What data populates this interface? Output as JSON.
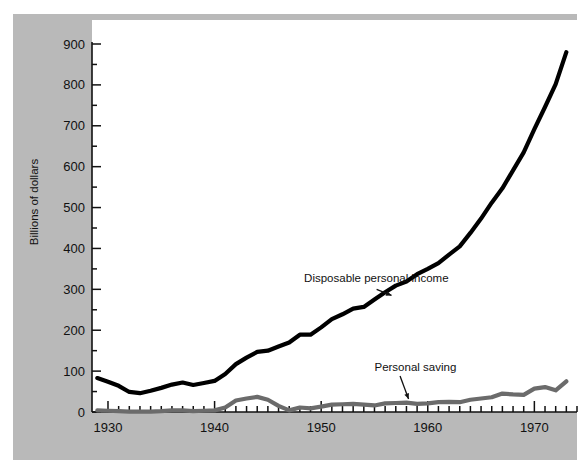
{
  "chart_data": {
    "type": "line",
    "title": "",
    "xlabel": "",
    "ylabel": "Billions of dollars",
    "xlim": [
      1928.5,
      1974
    ],
    "ylim": [
      0,
      930
    ],
    "grid": false,
    "legend_position": "inline-annotation",
    "x_ticks": [
      "1930",
      "1940",
      "1950",
      "1960",
      "1970"
    ],
    "x_tick_values": [
      1930,
      1940,
      1950,
      1960,
      1970
    ],
    "x_minor_tick_step": 2,
    "y_ticks": [
      "0",
      "100",
      "200",
      "300",
      "400",
      "500",
      "600",
      "700",
      "800",
      "900"
    ],
    "y_tick_values": [
      0,
      100,
      200,
      300,
      400,
      500,
      600,
      700,
      800,
      900
    ],
    "y_minor_tick_step": 50,
    "x": [
      1929,
      1930,
      1931,
      1932,
      1933,
      1934,
      1935,
      1936,
      1937,
      1938,
      1939,
      1940,
      1941,
      1942,
      1943,
      1944,
      1945,
      1946,
      1947,
      1948,
      1949,
      1950,
      1951,
      1952,
      1953,
      1954,
      1955,
      1956,
      1957,
      1958,
      1959,
      1960,
      1961,
      1962,
      1963,
      1964,
      1965,
      1966,
      1967,
      1968,
      1969,
      1970,
      1971,
      1972,
      1973
    ],
    "series": [
      {
        "name": "Disposable personal income",
        "color": "#000000",
        "width": 4.2,
        "values": [
          83,
          74,
          64,
          49,
          46,
          52,
          59,
          67,
          72,
          66,
          71,
          76,
          93,
          117,
          133,
          147,
          150,
          160,
          170,
          189,
          189,
          207,
          227,
          239,
          253,
          257,
          275,
          293,
          309,
          319,
          337,
          350,
          364,
          385,
          405,
          438,
          473,
          512,
          547,
          591,
          635,
          692,
          746,
          802,
          880
        ]
      },
      {
        "name": "Personal saving",
        "color": "#6b6b6b",
        "width": 4.2,
        "values": [
          4,
          3,
          2,
          1,
          1,
          1,
          2,
          4,
          4,
          2,
          3,
          4,
          11,
          28,
          33,
          37,
          30,
          15,
          4,
          11,
          9,
          13,
          18,
          19,
          20,
          18,
          16,
          21,
          22,
          23,
          20,
          21,
          24,
          25,
          24,
          30,
          33,
          36,
          45,
          43,
          42,
          57,
          61,
          53,
          75
        ]
      }
    ],
    "annotations": [
      {
        "text": "Disposable personal income",
        "x": 1948.4,
        "y": 318,
        "points_to": "black-line"
      },
      {
        "text": "Personal saving",
        "x": 1955.0,
        "y": 100,
        "points_to": "gray-line"
      }
    ]
  },
  "title_remnant": ""
}
